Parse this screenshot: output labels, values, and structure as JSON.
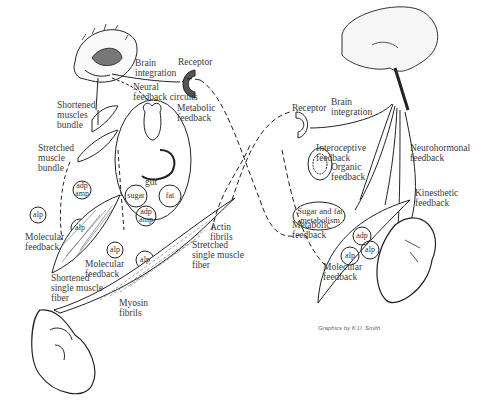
{
  "diagram": {
    "left_panel": {
      "labels": {
        "brain_integration": "Brain\nintegration",
        "receptor": "Receptor",
        "neural_feedback": "Neural\nfeedback circuits",
        "metabolic_feedback": "Metabolic\nfeedback",
        "shortened_bundle": "Shortened\nmuscles\nbundle",
        "stretched_bundle": "Stretched\nmuscle\nbundle",
        "gut": "gut",
        "sugar": "sugar",
        "fat": "fat",
        "adp_amp_1": "adp\namp",
        "adp_amp_2": "adp\namp",
        "alp_1": "alp",
        "alp_2": "alp",
        "alp_3": "alp",
        "alp_4": "alp",
        "molecular_feedback_1": "Molecular\nfeedback",
        "molecular_feedback_2": "Molecular\nfeedback",
        "shortened_fiber": "Shortened\nsingle muscle\nfiber",
        "actin": "Actin\nfibrils",
        "stretched_fiber": "Stretched\nsingle muscle\nfiber",
        "myosin": "Myosin\nfibrils"
      }
    },
    "right_panel": {
      "labels": {
        "receptor": "Receptor",
        "brain_integration": "Brain\nintegration",
        "neurohormonal": "Neurohormonal\nfeedback",
        "interoceptive": "Interoceptive\nfeedback",
        "organic": "Organic\nfeedback",
        "sugar_fat": "Sugar and fat\nmetabolism",
        "metabolic": "Metabolic\nfeedback",
        "kinesthetic": "Kinesthetic\nfeedback",
        "adp": "adp",
        "alp_1": "alp",
        "alp_2": "alp",
        "molecular": "Molecular\nfeedback"
      }
    },
    "caption": "Graphics by K.U. Smith"
  }
}
